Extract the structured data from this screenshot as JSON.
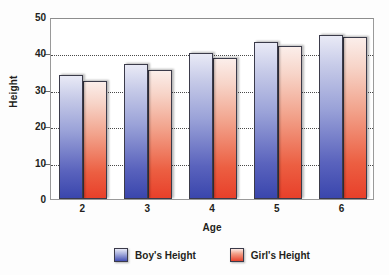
{
  "chart_data": {
    "type": "bar",
    "title": "",
    "xlabel": "Age",
    "ylabel": "Height",
    "categories": [
      "2",
      "3",
      "4",
      "5",
      "6"
    ],
    "series": [
      {
        "name": "Boy's Height",
        "color": "#4450b4",
        "values": [
          34,
          37,
          40,
          43,
          45
        ]
      },
      {
        "name": "Girl's Height",
        "color": "#e8422c",
        "values": [
          32.5,
          35.5,
          38.8,
          42,
          44.5
        ]
      }
    ],
    "ylim": [
      0,
      50
    ],
    "yticks": [
      0,
      10,
      20,
      30,
      40,
      50
    ],
    "ytick_labels": [
      "0",
      "10",
      "20",
      "30",
      "40",
      "50"
    ],
    "grid": true,
    "grid_axis": "y",
    "legend_position": "bottom"
  },
  "legend": {
    "entries": [
      {
        "label": "Boy's Height",
        "swatch": "blue-swatch"
      },
      {
        "label": "Girl's Height",
        "swatch": "red-swatch"
      }
    ]
  }
}
